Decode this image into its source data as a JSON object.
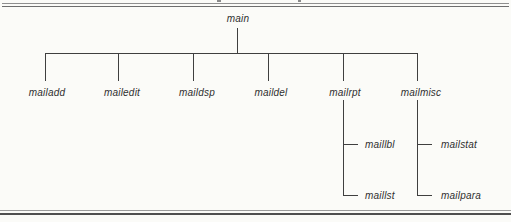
{
  "diagram_type": "call-hierarchy-tree",
  "colors": {
    "background": "#fbfbf8",
    "tree_line": "#3f3f3f",
    "label_text": "#2f2f2f",
    "top_rule": "#6e6e6e",
    "bottom_rule": "#4f4f4f"
  },
  "tree": {
    "root": {
      "label": "main"
    },
    "children": [
      {
        "label": "mailadd",
        "children": []
      },
      {
        "label": "mailedit",
        "children": []
      },
      {
        "label": "maildsp",
        "children": []
      },
      {
        "label": "maildel",
        "children": []
      },
      {
        "label": "mailrpt",
        "children": [
          {
            "label": "maillbl"
          },
          {
            "label": "maillst"
          }
        ]
      },
      {
        "label": "mailmisc",
        "children": [
          {
            "label": "mailstat"
          },
          {
            "label": "mailpara"
          }
        ]
      }
    ]
  }
}
